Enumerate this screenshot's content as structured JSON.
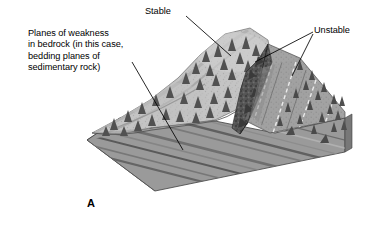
{
  "figure": {
    "panel_letter": "A",
    "type": "geological block diagram"
  },
  "annotations": {
    "planes_note": {
      "name": "planes-of-weakness-note",
      "lines": [
        "Planes of weakness",
        "in bedrock (in this case,",
        "bedding planes of",
        "sedimentary rock)"
      ],
      "text": "Planes of weakness\nin bedrock (in this case,\nbedding planes of\nsedimentary rock)"
    },
    "stable": {
      "name": "stable-label",
      "text": "Stable"
    },
    "unstable": {
      "name": "unstable-label",
      "text": "Unstable"
    }
  },
  "colors": {
    "text": "#000000",
    "background": "#ffffff",
    "leader_line": "#000000",
    "block_front_face": "#9a9a9a",
    "block_right_face": "#8a8a8a",
    "strata_dark": "#5c5c5c",
    "strata_light": "#bdbdbd",
    "hill_light": "#c9c9c9",
    "hill_mid": "#a6a6a6",
    "hill_shadow": "#7d7d7d",
    "cliff_rock": "#4a4a4a",
    "tree": "#4f4f4f",
    "dashed_bedding": "#f2f2f2"
  },
  "leaders": {
    "planes_note_leader": "diagonal line from note down-right to bedding planes on slope",
    "stable_leader": "line from Stable label down-right to gentle vegetated slope",
    "unstable_leader_upper": "line from Unstable label down-left to cliff face",
    "unstable_leader_lower": "line from Unstable label down-left to dip slope"
  }
}
